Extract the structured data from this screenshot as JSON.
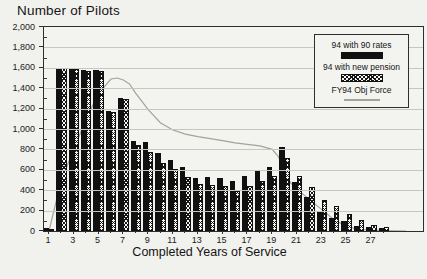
{
  "page": {
    "background": "#f1f1ed"
  },
  "colors": {
    "bar_solid": "#111111",
    "line": "#a6a29a",
    "grid": "#c7c7c1",
    "border": "#2e2e2e",
    "text": "#1b1b1b"
  },
  "chart_data": {
    "type": "bar",
    "title": "Number of Pilots",
    "xlabel": "Completed Years of Service",
    "ylim": [
      0,
      2000
    ],
    "ytick_step": 200,
    "ytick_labels": [
      "0",
      "200",
      "400",
      "600",
      "800",
      "1,000",
      "1,200",
      "1,400",
      "1,600",
      "1,800",
      "2,000"
    ],
    "categories": [
      1,
      2,
      3,
      4,
      5,
      6,
      7,
      8,
      9,
      10,
      11,
      12,
      13,
      14,
      15,
      16,
      17,
      18,
      19,
      20,
      21,
      22,
      23,
      24,
      25,
      26,
      27,
      28
    ],
    "xtick_labels": [
      "1",
      "3",
      "5",
      "7",
      "9",
      "11",
      "13",
      "15",
      "17",
      "19",
      "21",
      "23",
      "25",
      "27"
    ],
    "grid": "horizontal",
    "legend_position": "top-right",
    "series": [
      {
        "name": "94 with 90 rates",
        "type": "bar",
        "style": "solid",
        "values": [
          25,
          1600,
          1600,
          1580,
          1575,
          1180,
          1300,
          885,
          870,
          760,
          695,
          630,
          515,
          525,
          520,
          490,
          540,
          600,
          630,
          820,
          480,
          330,
          200,
          125,
          95,
          50,
          40,
          25
        ]
      },
      {
        "name": "94 with new pension",
        "type": "bar",
        "style": "crosshatch",
        "values": [
          15,
          1595,
          1590,
          1570,
          1565,
          1170,
          1295,
          845,
          775,
          670,
          605,
          525,
          460,
          450,
          445,
          395,
          445,
          495,
          540,
          720,
          540,
          430,
          300,
          245,
          170,
          110,
          55,
          35
        ]
      },
      {
        "name": "FY94 Obj Force",
        "type": "line",
        "style": "line",
        "points": [
          [
            1,
            0
          ],
          [
            2,
            500
          ],
          [
            3,
            800
          ],
          [
            4,
            1100
          ],
          [
            5,
            1350
          ],
          [
            6,
            1490
          ],
          [
            6.5,
            1500
          ],
          [
            7,
            1480
          ],
          [
            7.5,
            1440
          ],
          [
            8,
            1350
          ],
          [
            9,
            1190
          ],
          [
            10,
            1060
          ],
          [
            11,
            990
          ],
          [
            12,
            950
          ],
          [
            13,
            925
          ],
          [
            14,
            905
          ],
          [
            15,
            885
          ],
          [
            16,
            865
          ],
          [
            17,
            850
          ],
          [
            18,
            835
          ],
          [
            19,
            800
          ],
          [
            19.5,
            730
          ],
          [
            20,
            580
          ],
          [
            20.5,
            470
          ],
          [
            21,
            410
          ],
          [
            22,
            310
          ],
          [
            23,
            210
          ],
          [
            24,
            110
          ],
          [
            25,
            45
          ],
          [
            26,
            15
          ],
          [
            27,
            8
          ],
          [
            28,
            4
          ],
          [
            29.8,
            0
          ]
        ]
      }
    ]
  }
}
